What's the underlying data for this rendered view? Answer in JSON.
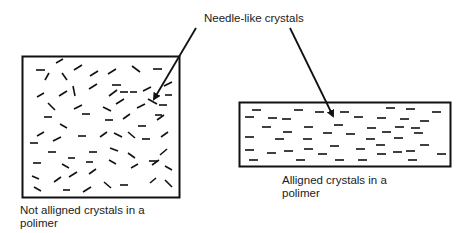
{
  "title": "Needle-like crystals",
  "left_panel": {
    "caption_line1": "Not alligned crystals in a",
    "caption_line2": "polimer",
    "box": {
      "x": 22,
      "y": 56,
      "w": 158,
      "h": 142
    }
  },
  "right_panel": {
    "caption_line1": "Alligned crystals in a",
    "caption_line2": "polimer",
    "box": {
      "x": 239,
      "y": 102,
      "w": 212,
      "h": 65
    }
  },
  "colors": {
    "stroke": "#111111",
    "background": "#ffffff"
  }
}
